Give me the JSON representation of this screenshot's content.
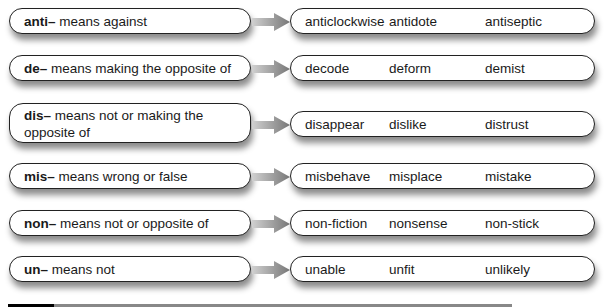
{
  "rows": [
    {
      "prefix": "anti–",
      "meaning": " means against",
      "examples": [
        "anticlockwise",
        "antidote",
        "antiseptic"
      ]
    },
    {
      "prefix": "de–",
      "meaning": " means making the opposite of",
      "examples": [
        "decode",
        "deform",
        "demist"
      ]
    },
    {
      "prefix": "dis–",
      "meaning": " means not or making the opposite of",
      "examples": [
        "disappear",
        "dislike",
        "distrust"
      ]
    },
    {
      "prefix": "mis–",
      "meaning": " means wrong or false",
      "examples": [
        "misbehave",
        "misplace",
        "mistake"
      ]
    },
    {
      "prefix": "non–",
      "meaning": " means not or opposite of",
      "examples": [
        "non-fiction",
        "nonsense",
        "non-stick"
      ]
    },
    {
      "prefix": "un–",
      "meaning": " means not",
      "examples": [
        "unable",
        "unfit",
        "unlikely"
      ]
    }
  ],
  "colors": {
    "arrow": "#8a8a8a",
    "border": "#222222",
    "divider": "#888888"
  }
}
